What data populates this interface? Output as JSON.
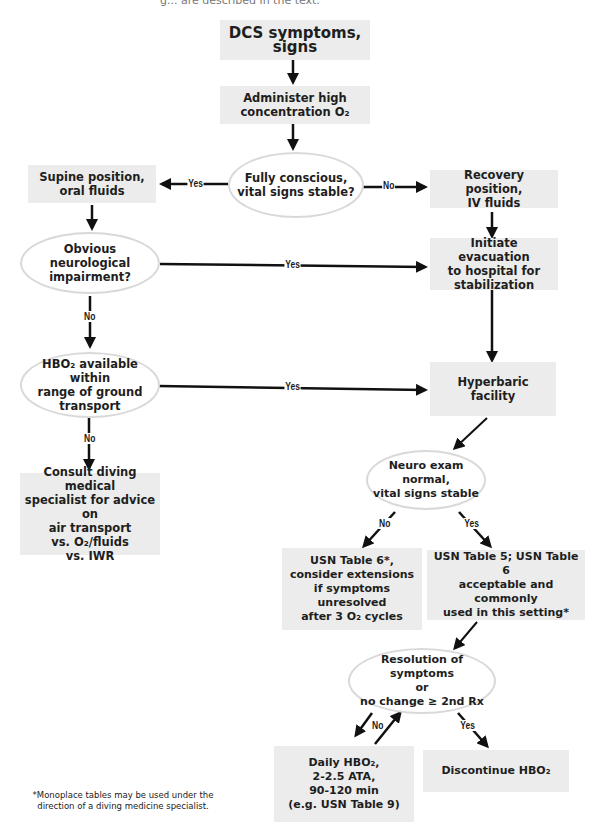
{
  "caption_fragment": "g... are described in the text.",
  "nodes": {
    "start": "DCS symptoms, signs",
    "administer_o2": "Administer high\nconcentration O₂",
    "fully_conscious": "Fully conscious,\nvital signs stable?",
    "supine": "Supine position,\noral fluids",
    "recovery": "Recovery position,\nIV fluids",
    "neuro_impairment": "Obvious neurological\nimpairment?",
    "evacuation": "Initiate evacuation\nto hospital for\nstabilization",
    "hbo2_available": "HBO₂ available within\nrange of ground\ntransport",
    "hyperbaric_facility": "Hyperbaric\nfacility",
    "consult": "Consult diving medical\nspecialist for advice on\nair transport\nvs. O₂/fluids\nvs. IWR",
    "neuro_exam": "Neuro exam normal,\nvital signs stable",
    "usn_table6": "USN Table 6*,\nconsider extensions\nif symptoms unresolved\nafter 3 O₂ cycles",
    "usn_table5": "USN Table 5; USN Table 6\nacceptable and commonly\nused in this setting*",
    "resolution": "Resolution of symptoms\nor\nno change ≥ 2nd Rx",
    "daily_hbo2": "Daily HBO₂,\n2-2.5 ATA,\n90-120 min\n(e.g. USN Table 9)",
    "discontinue": "Discontinue HBO₂"
  },
  "edge_labels": {
    "yes": "Yes",
    "no": "No"
  },
  "footnote": "*Monoplace tables may be used under the\ndirection of a diving medicine specialist."
}
